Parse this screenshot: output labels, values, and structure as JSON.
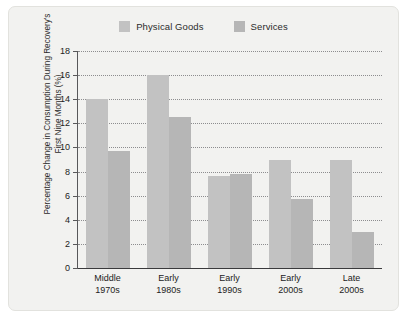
{
  "chart_data": {
    "type": "bar",
    "title": "",
    "subtitle": "",
    "xlabel": "",
    "ylabel": "Percentage Change in Consumption During Recovery's First Nine Months (%)",
    "categories": [
      "Middle 1970s",
      "Early 1980s",
      "Early 1990s",
      "Early 2000s",
      "Late 2000s"
    ],
    "category_lines": [
      [
        "Middle",
        "1970s"
      ],
      [
        "Early",
        "1980s"
      ],
      [
        "Early",
        "1990s"
      ],
      [
        "Early",
        "2000s"
      ],
      [
        "Late",
        "2000s"
      ]
    ],
    "series": [
      {
        "name": "Physical Goods",
        "color": "#c2c2c2",
        "values": [
          14.0,
          16.0,
          7.6,
          9.0,
          9.0
        ]
      },
      {
        "name": "Services",
        "color": "#b6b6b6",
        "values": [
          9.7,
          12.5,
          7.8,
          5.75,
          3.0
        ]
      }
    ],
    "ylim": [
      0,
      18
    ],
    "ytick_labels": [
      "18",
      "16",
      "14",
      "12",
      "10",
      "8",
      "6",
      "4",
      "2",
      "0"
    ],
    "ytick_values": [
      18,
      16,
      14,
      12,
      10,
      8,
      6,
      4,
      2,
      0
    ],
    "ytick_step": 2,
    "grid": true,
    "grid_style": "dotted",
    "grid_color": "#8d8d8f",
    "legend_position": "top-center",
    "axis_color": "#3a3a3c",
    "plot_background": "#f2f2f0",
    "page_background": "#ffffff"
  }
}
